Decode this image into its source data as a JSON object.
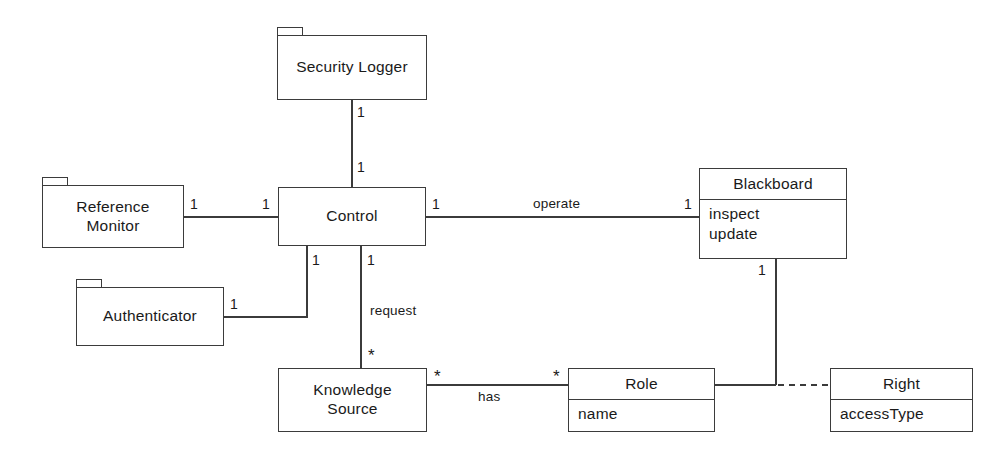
{
  "diagram": {
    "type": "uml-class-diagram",
    "title": "",
    "stroke_color": "#3b3b3b",
    "background_color": "#ffffff",
    "text_color": "#1a1a1a"
  },
  "nodes": [
    {
      "id": "security-logger",
      "name": "Security Logger",
      "kind": "package",
      "x": 277,
      "y": 35,
      "w": 150,
      "h": 65,
      "tab": {
        "x": 277,
        "y": 27,
        "w": 26,
        "h": 8
      }
    },
    {
      "id": "reference-monitor",
      "name": "Reference Monitor",
      "kind": "package",
      "x": 42,
      "y": 185,
      "w": 142,
      "h": 63,
      "tab": {
        "x": 42,
        "y": 177,
        "w": 26,
        "h": 8
      }
    },
    {
      "id": "control",
      "name": "Control",
      "kind": "class-simple",
      "x": 278,
      "y": 187,
      "w": 148,
      "h": 59
    },
    {
      "id": "blackboard",
      "name": "Blackboard",
      "kind": "class",
      "x": 699,
      "y": 168,
      "w": 148,
      "h": 91,
      "operations": [
        "inspect",
        "update"
      ]
    },
    {
      "id": "authenticator",
      "name": "Authenticator",
      "kind": "package",
      "x": 76,
      "y": 287,
      "w": 148,
      "h": 59,
      "tab": {
        "x": 76,
        "y": 279,
        "w": 26,
        "h": 8
      }
    },
    {
      "id": "knowledge-source",
      "name": "Knowledge\nSource",
      "kind": "class-simple",
      "x": 278,
      "y": 368,
      "w": 149,
      "h": 64
    },
    {
      "id": "role",
      "name": "Role",
      "kind": "class",
      "x": 568,
      "y": 368,
      "w": 147,
      "h": 64,
      "attributes": [
        "name"
      ]
    },
    {
      "id": "right",
      "name": "Right",
      "kind": "class",
      "x": 830,
      "y": 368,
      "w": 143,
      "h": 64,
      "attributes": [
        "accessType"
      ]
    }
  ],
  "edges": [
    {
      "id": "security-logger-control",
      "from": "security-logger",
      "to": "control",
      "style": "solid",
      "label": "",
      "source_multiplicity": "1",
      "target_multiplicity": "1"
    },
    {
      "id": "reference-monitor-control",
      "from": "reference-monitor",
      "to": "control",
      "style": "solid",
      "label": "",
      "source_multiplicity": "1",
      "target_multiplicity": "1"
    },
    {
      "id": "control-blackboard",
      "from": "control",
      "to": "blackboard",
      "style": "solid",
      "label": "operate",
      "source_multiplicity": "1",
      "target_multiplicity": "1"
    },
    {
      "id": "authenticator-control",
      "from": "authenticator",
      "to": "control",
      "style": "solid-elbow",
      "label": "",
      "source_multiplicity": "1",
      "target_multiplicity": "1"
    },
    {
      "id": "control-knowledge-source",
      "from": "control",
      "to": "knowledge-source",
      "style": "solid",
      "label": "request",
      "source_multiplicity": "1",
      "target_multiplicity": "*"
    },
    {
      "id": "knowledge-source-role",
      "from": "knowledge-source",
      "to": "role",
      "style": "solid",
      "label": "has",
      "source_multiplicity": "*",
      "target_multiplicity": "*"
    },
    {
      "id": "blackboard-right",
      "from": "blackboard",
      "to": "right",
      "style": "dashed-elbow",
      "label": "",
      "source_multiplicity": "1",
      "target_multiplicity": ""
    }
  ],
  "labels": {
    "operate": "operate",
    "request": "request",
    "has": "has",
    "one": "1",
    "many": "*"
  }
}
